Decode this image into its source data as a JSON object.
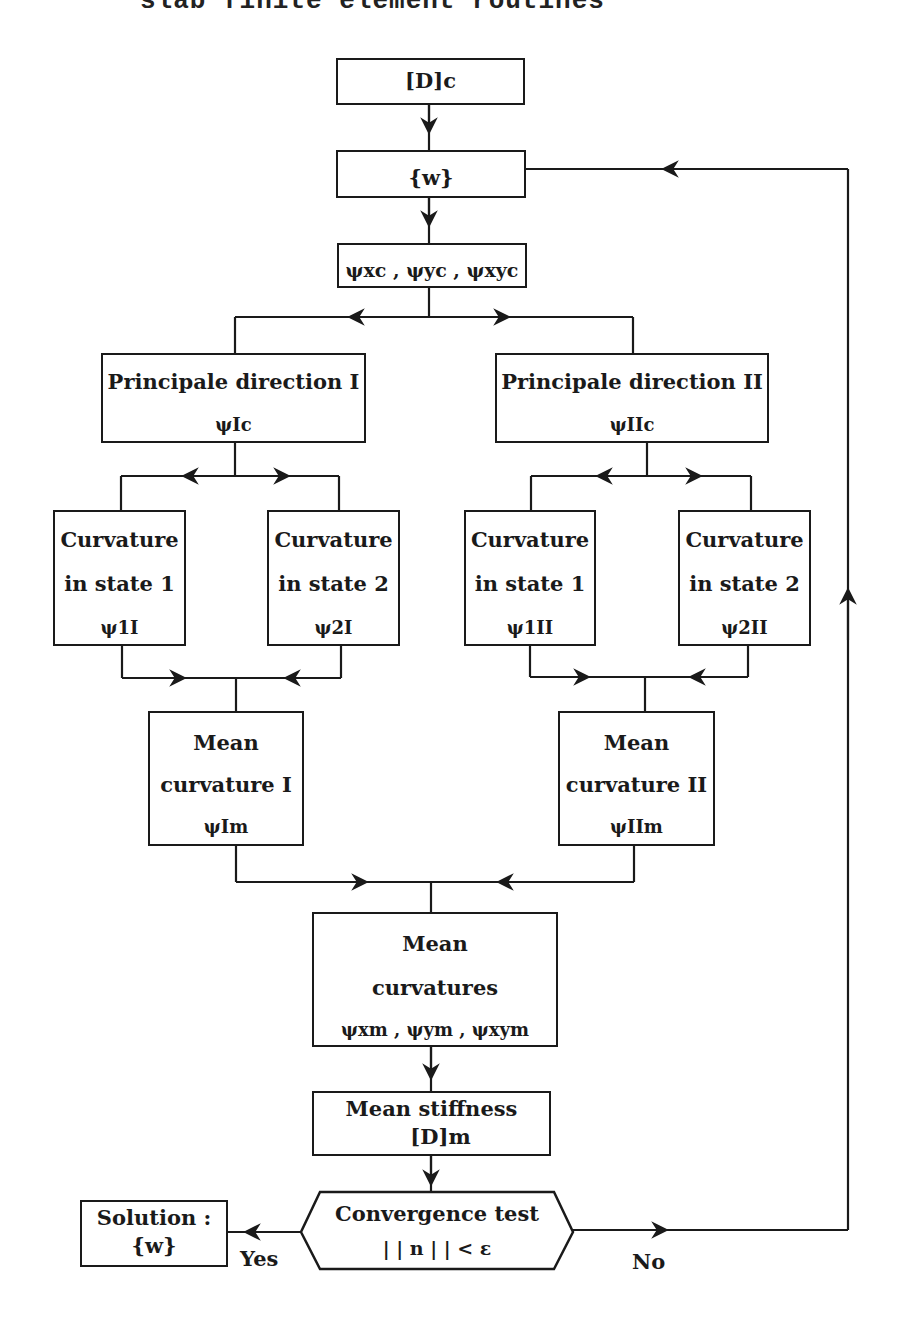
{
  "header": {
    "partial_title": "slab finite element routines"
  },
  "nodes": {
    "dc": {
      "label": "[D]c"
    },
    "w": {
      "label": "{w}"
    },
    "psi_c": {
      "label": "ψxc , ψyc , ψxyc"
    },
    "dir1": {
      "title": "Principale direction I",
      "symbol": "ψIc"
    },
    "dir2": {
      "title": "Principale direction II",
      "symbol": "ψIIc"
    },
    "curv1_s1": {
      "line1": "Curvature",
      "line2": "in state 1",
      "symbol": "ψ1I"
    },
    "curv1_s2": {
      "line1": "Curvature",
      "line2": "in state 2",
      "symbol": "ψ2I"
    },
    "curv2_s1": {
      "line1": "Curvature",
      "line2": "in state 1",
      "symbol": "ψ1II"
    },
    "curv2_s2": {
      "line1": "Curvature",
      "line2": "in state 2",
      "symbol": "ψ2II"
    },
    "mean1": {
      "line1": "Mean",
      "line2": "curvature I",
      "symbol": "ψIm"
    },
    "mean2": {
      "line1": "Mean",
      "line2": "curvature II",
      "symbol": "ψIIm"
    },
    "mean_all": {
      "line1": "Mean",
      "line2": "curvatures",
      "symbol": "ψxm , ψym , ψxym"
    },
    "stiffness": {
      "line1": "Mean stiffness",
      "line2": "[D]m"
    },
    "convergence": {
      "line1": "Convergence test",
      "line2": "| | n | | < ε"
    },
    "solution": {
      "line1": "Solution :",
      "line2": "{w}"
    }
  },
  "edges": {
    "yes_label": "Yes",
    "no_label": "No"
  },
  "colors": {
    "ink": "#1a1a1a",
    "background": "#ffffff"
  }
}
